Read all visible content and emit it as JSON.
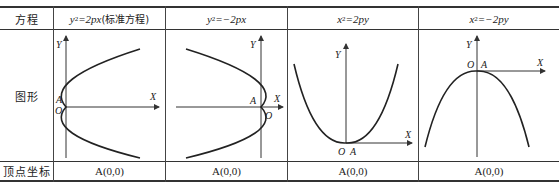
{
  "table": {
    "row_labels": {
      "equation": "方程",
      "graph": "图形",
      "vertex": "顶点坐标"
    },
    "columns": [
      {
        "equation_lhs": "y",
        "equation_power": "2",
        "equation_rhs": "=2px",
        "equation_note": "(标准方程)",
        "opening": "right",
        "vertex": "A(0,0)",
        "labels": {
          "y_axis": "Y",
          "x_axis": "X",
          "origin": "O",
          "vertex": "A"
        }
      },
      {
        "equation_lhs": "y",
        "equation_power": "2",
        "equation_rhs": "=−2px",
        "equation_note": "",
        "opening": "left",
        "vertex": "A(0,0)",
        "labels": {
          "y_axis": "Y",
          "x_axis": "X",
          "origin": "O",
          "vertex": "A"
        }
      },
      {
        "equation_lhs": "x",
        "equation_power": "2",
        "equation_rhs": "=2py",
        "equation_note": "",
        "opening": "up",
        "vertex": "A(0,0)",
        "labels": {
          "y_axis": "Y",
          "x_axis": "X",
          "origin": "O",
          "vertex": "A"
        }
      },
      {
        "equation_lhs": "x",
        "equation_power": "2",
        "equation_rhs": "=−2py",
        "equation_note": "",
        "opening": "down",
        "vertex": "A(0,0)",
        "labels": {
          "y_axis": "Y",
          "x_axis": "X",
          "origin": "O",
          "vertex": "A"
        }
      }
    ]
  }
}
